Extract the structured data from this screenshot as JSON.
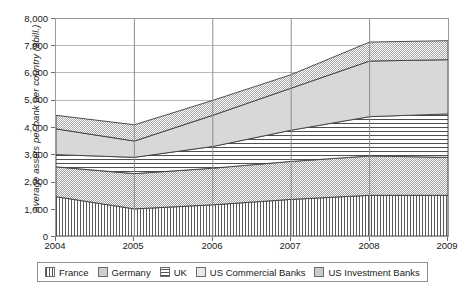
{
  "chart_data": {
    "type": "area",
    "stacked": true,
    "title": "",
    "xlabel": "",
    "ylabel": "Average assets per bank per country ($bill.)",
    "x": [
      2004,
      2005,
      2006,
      2007,
      2008,
      2009
    ],
    "xtick_labels": [
      "2004",
      "2005",
      "2006",
      "2007",
      "2008",
      "2009"
    ],
    "ytick_labels": [
      "8,000",
      "7,000",
      "6,000",
      "5,000",
      "4,000",
      "3,000",
      "2,000",
      "1,000",
      "0"
    ],
    "ylim": [
      0,
      8000
    ],
    "ytick_step": 1000,
    "grid": true,
    "legend_position": "bottom",
    "series": [
      {
        "name": "France",
        "pattern": "vertical-lines",
        "values": [
          1450,
          1000,
          1150,
          1350,
          1500,
          1500
        ]
      },
      {
        "name": "Germany",
        "pattern": "checkered-gray",
        "values": [
          1100,
          1300,
          1350,
          1400,
          1450,
          1400
        ]
      },
      {
        "name": "UK",
        "pattern": "horizontal-lines",
        "values": [
          450,
          600,
          800,
          1150,
          1450,
          1600
        ]
      },
      {
        "name": "US Commercial Banks",
        "pattern": "solid-light-gray",
        "values": [
          950,
          600,
          1150,
          1550,
          2050,
          2000
        ]
      },
      {
        "name": "US Investment Banks",
        "pattern": "checkered-gray",
        "values": [
          500,
          600,
          550,
          500,
          700,
          700
        ]
      }
    ],
    "cumulative_tops": {
      "France": [
        1450,
        1000,
        1150,
        1350,
        1500,
        1500
      ],
      "Germany": [
        2550,
        2300,
        2500,
        2750,
        2950,
        2900
      ],
      "UK": [
        3000,
        2900,
        3300,
        3900,
        4400,
        4500
      ],
      "US Commercial Banks": [
        3950,
        3500,
        4450,
        5450,
        6450,
        6500
      ],
      "US Investment Banks": [
        4450,
        4100,
        5000,
        5950,
        7150,
        7200
      ]
    }
  },
  "legend": {
    "items": [
      {
        "label": "France"
      },
      {
        "label": "Germany"
      },
      {
        "label": "UK"
      },
      {
        "label": "US Commercial Banks"
      },
      {
        "label": "US Investment Banks"
      }
    ]
  }
}
